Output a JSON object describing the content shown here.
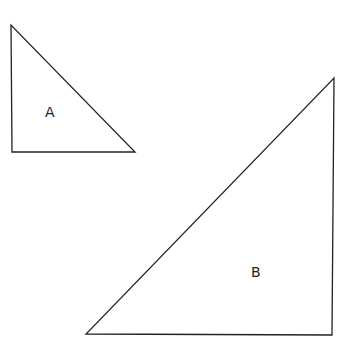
{
  "diagram": {
    "background": "#ffffff",
    "stroke_color": "#222222",
    "shapes": [
      {
        "id": "A",
        "type": "right-triangle",
        "label": "A",
        "points": "11,25 12,152 135,152",
        "label_pos": {
          "x": 45,
          "y": 117
        }
      },
      {
        "id": "B",
        "type": "right-triangle",
        "label": "B",
        "points": "334,78 332,335 86,334",
        "label_pos": {
          "x": 251,
          "y": 277
        }
      }
    ]
  }
}
